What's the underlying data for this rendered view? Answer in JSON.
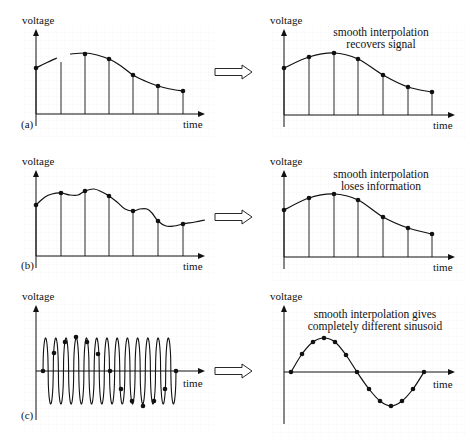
{
  "figure": {
    "axis_label_y": "voltage",
    "axis_label_x": "time",
    "grid_color": "#f1f1f1",
    "ink_color": "#111111",
    "arrow_icon": "hollow-right-arrow-icon"
  },
  "rows": [
    {
      "label": "(a)",
      "caption_lines": [
        "smooth interpolation",
        "recovers signal"
      ],
      "left": {
        "origin": [
          36,
          114
        ],
        "y_top": 29,
        "x_end": 205,
        "samples_x": [
          36,
          61,
          85,
          109,
          133,
          158,
          183
        ],
        "samples_y": [
          68,
          null,
          54,
          59,
          75,
          86,
          91
        ],
        "stem_only": [
          61
        ],
        "curve_segments": [
          [
            [
              36,
              68
            ],
            [
              46,
              63
            ],
            [
              57,
              58
            ]
          ],
          [
            [
              70,
              54
            ],
            [
              85,
              53
            ],
            [
              97,
              55
            ],
            [
              109,
              59
            ],
            [
              121,
              66
            ],
            [
              133,
              75
            ],
            [
              145,
              81
            ],
            [
              158,
              86
            ],
            [
              170,
              89
            ],
            [
              183,
              91
            ]
          ]
        ]
      },
      "right": {
        "origin": [
          284,
          115
        ],
        "y_top": 29,
        "x_end": 455,
        "samples_x": [
          284,
          309,
          334,
          358,
          383,
          408,
          432
        ],
        "samples_y": [
          68,
          57,
          53,
          59,
          75,
          87,
          92
        ]
      }
    },
    {
      "label": "(b)",
      "caption_lines": [
        "smooth interpolation",
        "loses information"
      ],
      "left": {
        "origin": [
          36,
          256
        ],
        "y_top": 170,
        "x_end": 205,
        "samples_x": [
          36,
          61,
          85,
          109,
          133,
          158,
          183
        ],
        "samples_y": [
          205,
          193,
          191,
          196,
          211,
          221,
          224
        ],
        "curve_segments": [
          [
            [
              36,
              205
            ],
            [
              45,
              197
            ],
            [
              52,
              194
            ],
            [
              61,
              193
            ],
            [
              70,
              195
            ],
            [
              78,
              195
            ],
            [
              85,
              191
            ],
            [
              94,
              189
            ],
            [
              102,
              192
            ],
            [
              109,
              196
            ],
            [
              117,
              202
            ],
            [
              125,
              209
            ],
            [
              133,
              211
            ],
            [
              140,
              209
            ],
            [
              147,
              209
            ],
            [
              152,
              213
            ],
            [
              158,
              221
            ],
            [
              166,
              226
            ],
            [
              174,
              226
            ],
            [
              183,
              224
            ],
            [
              195,
              222
            ],
            [
              205,
              220
            ]
          ]
        ]
      },
      "right": {
        "origin": [
          284,
          257
        ],
        "y_top": 170,
        "x_end": 455,
        "samples_x": [
          284,
          309,
          334,
          358,
          383,
          408,
          432
        ],
        "samples_y": [
          210,
          198,
          194,
          200,
          217,
          228,
          234
        ]
      }
    },
    {
      "label": "(c)",
      "caption_lines": [
        "smooth interpolation gives",
        "completely different sinusoid"
      ],
      "left": {
        "origin": [
          36,
          371
        ],
        "y_top": 305,
        "y_bottom": 420,
        "x_end": 205,
        "wave": {
          "x_start": 43,
          "x_end": 176,
          "amplitude": 33,
          "cycles": 13
        },
        "samples_x": [
          43,
          54,
          65,
          76,
          87,
          98,
          110,
          121,
          132,
          143,
          154,
          165,
          176
        ],
        "samples_y": [
          371,
          353,
          342,
          337,
          342,
          354,
          371,
          389,
          401,
          406,
          401,
          389,
          371
        ]
      },
      "right": {
        "origin": [
          284,
          372
        ],
        "y_top": 305,
        "y_bottom": 424,
        "x_end": 455,
        "samples_x": [
          291,
          302,
          313,
          324,
          335,
          346,
          357,
          369,
          380,
          391,
          402,
          413,
          424
        ],
        "samples_y": [
          372,
          354,
          342,
          338,
          342,
          355,
          372,
          389,
          401,
          406,
          401,
          389,
          372
        ]
      }
    }
  ],
  "arrows": [
    {
      "x": 215,
      "y": 72
    },
    {
      "x": 215,
      "y": 217
    },
    {
      "x": 215,
      "y": 371
    }
  ]
}
